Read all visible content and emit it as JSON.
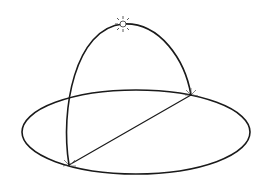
{
  "diagram": {
    "title": "Sun path over horizon plane",
    "stroke_color": "#1a1a1a",
    "background": "#ffffff",
    "horizon_ellipse": {
      "cx": 136,
      "cy": 132,
      "rx": 114,
      "ry": 42
    },
    "sun": {
      "x": 123,
      "y": 24,
      "label": "sun-icon"
    },
    "sunrise_point": {
      "x": 69,
      "y": 165
    },
    "sunset_point": {
      "x": 191,
      "y": 95
    }
  }
}
